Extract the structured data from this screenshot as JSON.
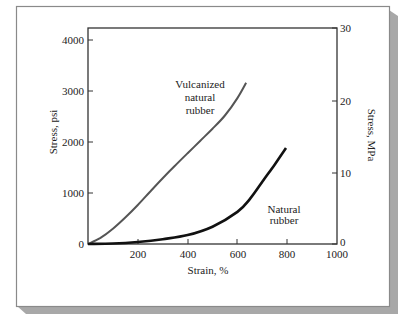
{
  "chart_data": {
    "type": "line",
    "title": "",
    "xlabel": "Strain, %",
    "ylabel": "Stress, psi",
    "ylabel_right": "Stress, MPa",
    "xlim": [
      0,
      1000
    ],
    "ylim": [
      0,
      4000
    ],
    "ylim_right": [
      0,
      30
    ],
    "x_ticks": [
      200,
      400,
      600,
      800,
      1000
    ],
    "x_tick_labels": [
      "200",
      "400",
      "600",
      "800",
      "1000"
    ],
    "y_ticks": [
      0,
      1000,
      2000,
      3000,
      4000
    ],
    "y_tick_labels": [
      "0",
      "1000",
      "2000",
      "3000",
      "4000"
    ],
    "y_right_ticks": [
      0,
      10,
      20,
      30
    ],
    "y_right_tick_labels": [
      "0",
      "10",
      "20",
      "30"
    ],
    "grid": false,
    "legend": null,
    "series": [
      {
        "name": "Vulcanized natural rubber",
        "color": "#555555",
        "x": [
          0,
          50,
          100,
          150,
          200,
          250,
          300,
          350,
          400,
          450,
          500,
          550,
          600,
          635
        ],
        "y": [
          0,
          120,
          300,
          520,
          765,
          1030,
          1290,
          1540,
          1780,
          2020,
          2260,
          2520,
          2860,
          3160
        ]
      },
      {
        "name": "Natural rubber",
        "color": "#111111",
        "x": [
          0,
          100,
          200,
          300,
          400,
          500,
          600,
          650,
          700,
          750,
          795
        ],
        "y": [
          0,
          10,
          40,
          95,
          175,
          340,
          630,
          880,
          1220,
          1560,
          1880
        ]
      }
    ],
    "annotations": [
      {
        "text": "Vulcanized\nnatural\nrubber",
        "near_series": "Vulcanized natural rubber"
      },
      {
        "text": "Natural\nrubber",
        "near_series": "Natural rubber"
      }
    ]
  },
  "labels": {
    "xlabel": "Strain, %",
    "ylabel_left": "Stress, psi",
    "ylabel_right": "Stress, MPa",
    "vulc_line1": "Vulcanized",
    "vulc_line2": "natural",
    "vulc_line3": "rubber",
    "nat_line1": "Natural",
    "nat_line2": "rubber",
    "xt": [
      "200",
      "400",
      "600",
      "800",
      "1000"
    ],
    "yt": [
      "0",
      "1000",
      "2000",
      "3000",
      "4000"
    ],
    "yr": [
      "0",
      "10",
      "20",
      "30"
    ]
  }
}
